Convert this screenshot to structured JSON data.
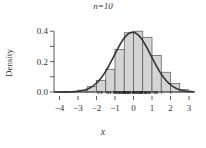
{
  "chart_data": {
    "type": "bar",
    "title": "n=10",
    "title_italic_part": "n",
    "xlabel": "x",
    "ylabel": "Density",
    "xlim": [
      -4.3,
      3.3
    ],
    "ylim": [
      0,
      0.45
    ],
    "x_ticks": [
      -4,
      -3,
      -2,
      -1,
      0,
      1,
      2,
      3
    ],
    "x_tick_labels": [
      "−4",
      "−3",
      "−2",
      "−1",
      "0",
      "1",
      "2",
      "3"
    ],
    "y_ticks": [
      0.0,
      0.1,
      0.2,
      0.3,
      0.4
    ],
    "y_tick_labels": [
      "0.0",
      "",
      "0.2",
      "",
      "0.4"
    ],
    "grid": false,
    "histogram": {
      "bin_width": 0.5,
      "bin_edges": [
        -4.0,
        -3.5,
        -3.0,
        -2.5,
        -2.0,
        -1.5,
        -1.0,
        -0.5,
        0.0,
        0.5,
        1.0,
        1.5,
        2.0,
        2.5,
        3.0
      ],
      "values": [
        0.002,
        0.004,
        0.012,
        0.035,
        0.075,
        0.15,
        0.28,
        0.39,
        0.4,
        0.36,
        0.24,
        0.13,
        0.055,
        0.015
      ],
      "fill": "#d4d4d4",
      "edge": "#555555"
    },
    "density_curve": {
      "description": "smooth density overlay, approximately normal, peak ~0.39 near x=0",
      "mean": -0.05,
      "sd": 1.0,
      "color": "#333333"
    },
    "rug": {
      "description": "rug marks of observations along x-axis",
      "range": [
        -2.3,
        2.3
      ],
      "color": "#222222"
    }
  }
}
